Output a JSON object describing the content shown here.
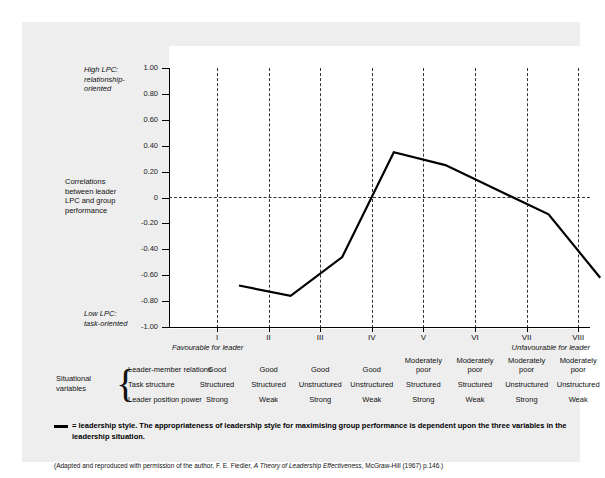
{
  "chart_data": {
    "type": "line",
    "title": "",
    "xlabel": "",
    "ylabel": "Correlations between leader LPC and group performance",
    "ylim": [
      -1.0,
      1.0
    ],
    "grid": "vertical dashed gridlines at each octant plus dashed zero line",
    "legend_position": "below-plot",
    "categories": [
      "I",
      "II",
      "III",
      "IV",
      "V",
      "VI",
      "VII",
      "VIII"
    ],
    "yticks": [
      "1.00",
      "0.80",
      "0.60",
      "0.40",
      "0.20",
      "0",
      "-0.20",
      "-0.40",
      "-0.60",
      "-0.80",
      "-1.00"
    ],
    "ytick_values": [
      1.0,
      0.8,
      0.6,
      0.4,
      0.2,
      0,
      -0.2,
      -0.4,
      -0.6,
      -0.8,
      -1.0
    ],
    "series": [
      {
        "name": "leadership style",
        "values": [
          -0.51,
          -0.59,
          -0.29,
          0.52,
          0.42,
          0.23,
          0.04,
          -0.45
        ]
      }
    ],
    "annotations": {
      "top_axis_note": "High LPC: relationship-oriented",
      "middle_axis_note": "Correlations between leader LPC and group performance",
      "bottom_axis_note": "Low LPC: task-oriented",
      "x_left": "Favourable for leader",
      "x_right": "Unfavourable for leader"
    }
  },
  "axis": {
    "high_lpc": "High LPC:\nrelationship-\noriented",
    "high_lpc_line1": "High LPC:",
    "high_lpc_line2": "relationship-",
    "high_lpc_line3": "oriented",
    "correlations_line1": "Correlations",
    "correlations_line2": "between leader",
    "correlations_line3": "LPC and group",
    "correlations_line4": "performance",
    "low_lpc_line1": "Low LPC:",
    "low_lpc_line2": "task-oriented",
    "favourable": "Favourable for leader",
    "unfavourable": "Unfavourable for leader"
  },
  "situational": {
    "group_label_line1": "Situational",
    "group_label_line2": "variables",
    "rows": [
      {
        "label": "Leader-member relations",
        "cells": [
          "Good",
          "Good",
          "Good",
          "Good",
          "Moderately poor",
          "Moderately poor",
          "Moderately poor",
          "Moderately poor"
        ]
      },
      {
        "label": "Task structure",
        "cells": [
          "Structured",
          "Structured",
          "Unstructured",
          "Unstructured",
          "Structured",
          "Structured",
          "Unstructured",
          "Unstructured"
        ]
      },
      {
        "label": "Leader position power",
        "cells": [
          "Strong",
          "Weak",
          "Strong",
          "Weak",
          "Strong",
          "Weak",
          "Strong",
          "Weak"
        ]
      }
    ]
  },
  "footer": {
    "legend_line1": "= leadership style.   The appropriateness of leadership style for maximising group performance is dependent upon the three variables in the",
    "legend_line2": "leadership situation.",
    "source_prefix": "(Adapted and reproduced with permission of the author, F. E. Fiedler, ",
    "source_italic": "A Theory of Leadership Effectiveness",
    "source_suffix": ", McGraw-Hill (1967) p.146.)"
  },
  "colors": {
    "card_background": "#eeeeee",
    "plot_background": "#ffffff",
    "line": "#000000",
    "grid": "#333333",
    "text": "#111111"
  }
}
